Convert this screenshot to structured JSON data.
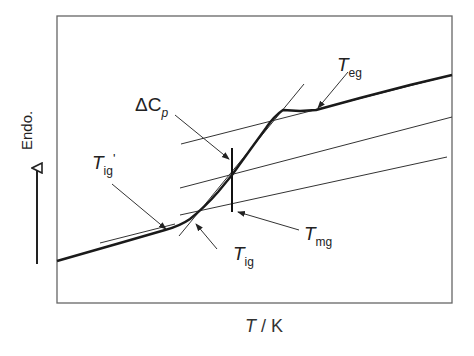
{
  "diagram": {
    "type": "DSC glass transition thermogram",
    "y_axis_label": "Endo.",
    "x_axis_label": {
      "var": "T",
      "unit": "K",
      "sep": " / "
    },
    "labels": {
      "delta_cp": {
        "main": "ΔC",
        "sub": "p"
      },
      "t_eg": {
        "main": "T",
        "sub": "eg"
      },
      "t_ig_prime": {
        "main": "T",
        "sub": "ig",
        "suffix": "'"
      },
      "t_ig": {
        "main": "T",
        "sub": "ig"
      },
      "t_mg": {
        "main": "T",
        "sub": "mg"
      }
    },
    "colors": {
      "curve": "#1a1a1a",
      "lines": "#333333",
      "frame": "#555555"
    }
  }
}
